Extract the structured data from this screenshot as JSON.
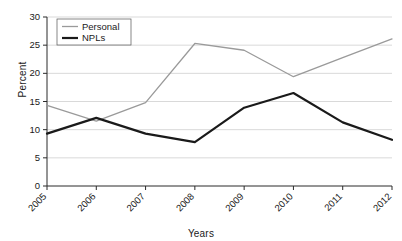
{
  "chart_data": {
    "type": "line",
    "title": "",
    "xlabel": "Years",
    "ylabel": "Percent",
    "categories": [
      "2005",
      "2006",
      "2007",
      "2008",
      "2009",
      "2010",
      "2011",
      "2012"
    ],
    "x": [
      2005,
      2006,
      2007,
      2008,
      2009,
      2010,
      2011,
      2012
    ],
    "series": [
      {
        "name": "Personal",
        "color": "#9a9a9a",
        "line_width": 1.3,
        "values": [
          14.3,
          11.5,
          14.8,
          25.3,
          24.1,
          19.4,
          22.8,
          26.1
        ]
      },
      {
        "name": "NPLs",
        "color": "#1a1a1a",
        "line_width": 2.2,
        "values": [
          9.3,
          12.1,
          9.3,
          7.8,
          13.9,
          16.5,
          11.3,
          8.2
        ]
      }
    ],
    "ylim": [
      0,
      30
    ],
    "yticks": [
      0,
      5,
      10,
      15,
      20,
      25,
      30
    ],
    "ytick_labels": [
      "0",
      "5",
      "10",
      "15",
      "20",
      "25",
      "30"
    ],
    "grid": "horizontal",
    "grid_color": "#c9c9c9",
    "legend_position": "top-left-inside",
    "xtick_rotation_degrees": -45,
    "background_color": "#ffffff",
    "axis_color": "#2b2b2b"
  }
}
